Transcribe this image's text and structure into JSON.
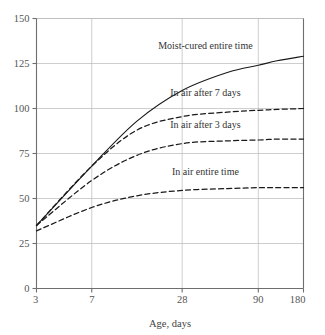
{
  "chart_data": {
    "type": "line",
    "title": "",
    "xlabel": "Age, days",
    "ylabel": "",
    "xlim": [
      3,
      180
    ],
    "ylim": [
      0,
      150
    ],
    "xscale": "log",
    "grid": true,
    "legend_position": "inline-annotations",
    "xticks": [
      3,
      7,
      28,
      90,
      180
    ],
    "xtick_labels": [
      "3",
      "7",
      "28",
      "90",
      "180"
    ],
    "yticks": [
      0,
      25,
      50,
      75,
      100,
      125,
      150
    ],
    "ytick_labels": [
      "0",
      "25",
      "50",
      "75",
      "100",
      "125",
      "150"
    ],
    "x": [
      3,
      7,
      14,
      28,
      56,
      90,
      120,
      180
    ],
    "series": [
      {
        "name": "Moist-cured entire time",
        "style": "solid",
        "color": "#1a1a1a",
        "values": [
          35,
          68,
          93,
          110,
          120,
          124,
          126.5,
          129
        ],
        "label_x": 40,
        "label_y": 133
      },
      {
        "name": "In air after 7 days",
        "style": "dashed",
        "color": "#1a1a1a",
        "values": [
          35,
          68,
          88,
          95.5,
          98,
          99,
          99.5,
          100
        ],
        "label_x": 40,
        "label_y": 107
      },
      {
        "name": "In air after 3 days",
        "style": "dashed",
        "color": "#1a1a1a",
        "values": [
          35,
          60,
          74,
          80.5,
          82,
          82.5,
          83,
          83
        ],
        "label_x": 40,
        "label_y": 89
      },
      {
        "name": "In air entire time",
        "style": "dashed",
        "color": "#1a1a1a",
        "values": [
          32,
          45,
          51.5,
          54.5,
          55.5,
          56,
          56,
          56
        ],
        "label_x": 40,
        "label_y": 63
      }
    ]
  },
  "colors": {
    "axis": "#6e6e6e",
    "grid": "#b9b9b9",
    "curve": "#1a1a1a",
    "text": "#3a3a3a",
    "background": "#ffffff"
  }
}
